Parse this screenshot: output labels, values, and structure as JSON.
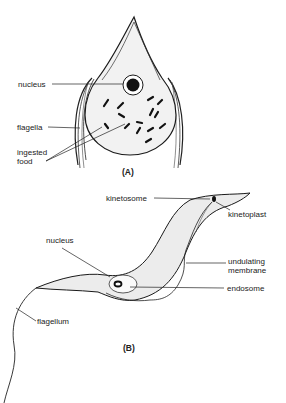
{
  "figure_a": {
    "caption": "(A)",
    "labels": {
      "nucleus": "nucleus",
      "flagella": "flagella",
      "ingested_food_line1": "ingested",
      "ingested_food_line2": "food"
    }
  },
  "figure_b": {
    "caption": "(B)",
    "labels": {
      "kinetosome": "kinetosome",
      "kinetoplast": "kinetoplast",
      "nucleus": "nucleus",
      "undulating_membrane_line1": "undulating",
      "undulating_membrane_line2": "membrane",
      "endosome": "endosome",
      "flagellum": "flagellum"
    }
  },
  "colors": {
    "ink": "#1a1a1a",
    "cell_fill": "#efefef",
    "background": "#ffffff"
  }
}
